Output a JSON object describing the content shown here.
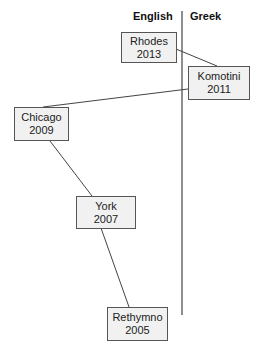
{
  "columns": {
    "left": "English",
    "right": "Greek"
  },
  "nodes": [
    {
      "id": "rhodes",
      "city": "Rhodes",
      "year": "2013",
      "column": "English"
    },
    {
      "id": "komotini",
      "city": "Komotini",
      "year": "2011",
      "column": "Greek"
    },
    {
      "id": "chicago",
      "city": "Chicago",
      "year": "2009",
      "column": "English"
    },
    {
      "id": "york",
      "city": "York",
      "year": "2007",
      "column": "English"
    },
    {
      "id": "rethymno",
      "city": "Rethymno",
      "year": "2005",
      "column": "English"
    }
  ],
  "edges": [
    {
      "from": "rhodes",
      "to": "komotini"
    },
    {
      "from": "komotini",
      "to": "chicago"
    },
    {
      "from": "chicago",
      "to": "york"
    },
    {
      "from": "york",
      "to": "rethymno"
    }
  ],
  "colors": {
    "line": "#444444",
    "box_fill": "#f1f1f1",
    "box_border": "#555555"
  }
}
